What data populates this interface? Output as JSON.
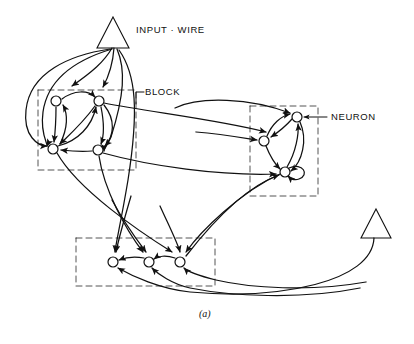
{
  "figure": {
    "caption": "(a)",
    "background": "#ffffff",
    "ink_color": "#111111",
    "node_fill": "#ffffff"
  },
  "labels": {
    "input_wire": "INPUT · WIRE",
    "block": "BLOCK",
    "neuron": "NEURON"
  },
  "diagram_data": {
    "type": "diagram",
    "description": "Schematic of a neural network built from blocks of neurons connected by wires",
    "triangles": [
      {
        "name": "input-wire-top",
        "apex_x": 113,
        "apex_y": 17,
        "base_y": 48,
        "half_width": 16
      },
      {
        "name": "input-wire-bottom-right",
        "apex_x": 376,
        "apex_y": 209,
        "base_y": 238,
        "half_width": 15
      }
    ],
    "blocks": [
      {
        "name": "block-left",
        "x": 38,
        "y": 90,
        "w": 98,
        "h": 80,
        "neuron_count": 4
      },
      {
        "name": "block-right",
        "x": 250,
        "y": 106,
        "w": 68,
        "h": 90,
        "neuron_count": 3
      },
      {
        "name": "block-bottom",
        "x": 76,
        "y": 238,
        "w": 139,
        "h": 48,
        "neuron_count": 3
      }
    ],
    "neurons": [
      {
        "id": "L1",
        "x": 56,
        "y": 101,
        "r": 5,
        "block": "block-left"
      },
      {
        "id": "L2",
        "x": 99,
        "y": 101,
        "r": 5,
        "block": "block-left"
      },
      {
        "id": "L3",
        "x": 53,
        "y": 149,
        "r": 5,
        "block": "block-left"
      },
      {
        "id": "L4",
        "x": 98,
        "y": 150,
        "r": 5,
        "block": "block-left"
      },
      {
        "id": "R1",
        "x": 297,
        "y": 117,
        "r": 5,
        "block": "block-right"
      },
      {
        "id": "R2",
        "x": 264,
        "y": 141,
        "r": 5,
        "block": "block-right"
      },
      {
        "id": "R3",
        "x": 285,
        "y": 172,
        "r": 5,
        "block": "block-right"
      },
      {
        "id": "B1",
        "x": 113,
        "y": 262,
        "r": 5,
        "block": "block-bottom"
      },
      {
        "id": "B2",
        "x": 149,
        "y": 262,
        "r": 5,
        "block": "block-bottom"
      },
      {
        "id": "B3",
        "x": 180,
        "y": 262,
        "r": 5,
        "block": "block-bottom"
      }
    ],
    "self_loops": [
      {
        "node": "R3",
        "side": "right"
      }
    ],
    "wire_count_from_input": 6,
    "leader_lines": [
      {
        "label": "BLOCK",
        "from_x": 136,
        "from_y": 92,
        "to_x": 136,
        "to_y": 104
      },
      {
        "label": "NEURON",
        "from_x": 326,
        "from_y": 117,
        "to_x": 303,
        "to_y": 117
      }
    ]
  }
}
